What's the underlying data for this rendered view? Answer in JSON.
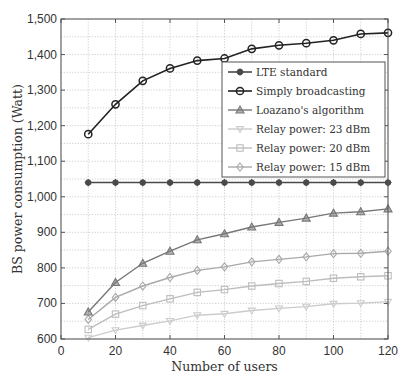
{
  "chart_data": {
    "type": "line",
    "title": "",
    "xlabel": "Number of users",
    "ylabel": "BS power consumption (Watt)",
    "xlim": [
      0,
      120
    ],
    "ylim": [
      600,
      1500
    ],
    "x_ticks": [
      0,
      20,
      40,
      60,
      80,
      100,
      120
    ],
    "y_ticks": [
      600,
      700,
      800,
      900,
      1000,
      1100,
      1200,
      1300,
      1400,
      1500
    ],
    "y_tick_labels": [
      "600",
      "700",
      "800",
      "900",
      "1,000",
      "1,100",
      "1,200",
      "1,300",
      "1,400",
      "1,500"
    ],
    "grid": true,
    "legend_position": "upper right (inside, below top curve)",
    "x": [
      10,
      20,
      30,
      40,
      50,
      60,
      70,
      80,
      90,
      100,
      110,
      120
    ],
    "series": [
      {
        "name": "LTE standard",
        "marker": "star",
        "color": "#4a4a4a",
        "values": [
          1040,
          1040,
          1040,
          1040,
          1040,
          1040,
          1040,
          1040,
          1040,
          1040,
          1040,
          1040
        ]
      },
      {
        "name": "Simply broadcasting",
        "marker": "circle",
        "color": "#222222",
        "values": [
          1176,
          1260,
          1326,
          1361,
          1383,
          1389,
          1416,
          1426,
          1432,
          1440,
          1458,
          1461
        ]
      },
      {
        "name": "Loazano's algorithm",
        "marker": "triangle-up",
        "color": "#777777",
        "values": [
          676,
          759,
          813,
          847,
          879,
          896,
          915,
          928,
          940,
          954,
          958,
          966
        ]
      },
      {
        "name": "Relay power: 23 dBm",
        "marker": "triangle-down",
        "color": "#cccccc",
        "values": [
          604,
          625,
          638,
          651,
          667,
          671,
          680,
          686,
          691,
          699,
          701,
          705
        ]
      },
      {
        "name": "Relay power: 20 dBm",
        "marker": "square",
        "color": "#bdbdbd",
        "values": [
          627,
          670,
          694,
          713,
          731,
          739,
          749,
          756,
          762,
          771,
          775,
          778
        ]
      },
      {
        "name": "Relay power: 15 dBm",
        "marker": "diamond",
        "color": "#a9a9a9",
        "values": [
          655,
          717,
          749,
          773,
          793,
          803,
          817,
          824,
          831,
          840,
          841,
          847
        ]
      }
    ]
  }
}
